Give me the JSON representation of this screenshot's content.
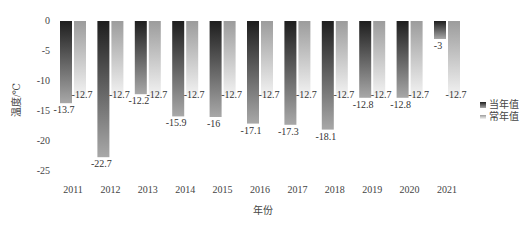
{
  "chart_data": {
    "type": "bar",
    "title": "",
    "xlabel": "年份",
    "ylabel": "温度/℃",
    "ylim": [
      -25,
      0
    ],
    "yticks": [
      0,
      -5,
      -10,
      -15,
      -20,
      -25
    ],
    "ytick_labels": [
      "0",
      "-5",
      "-10",
      "-15",
      "-20",
      "-25"
    ],
    "grid": false,
    "legend_position": "right",
    "categories": [
      "2011",
      "2012",
      "2013",
      "2014",
      "2015",
      "2016",
      "2017",
      "2018",
      "2019",
      "2020",
      "2021"
    ],
    "series": [
      {
        "name": "当年值",
        "color": "#2b2b2b",
        "values": [
          -13.7,
          -22.7,
          -12.2,
          -15.9,
          -16,
          -17.1,
          -17.3,
          -18.1,
          -12.8,
          -12.8,
          -3
        ],
        "labels": [
          "-13.7",
          "-22.7",
          "-12.2",
          "-15.9",
          "-16",
          "-17.1",
          "-17.3",
          "-18.1",
          "-12.8",
          "-12.8",
          "-3"
        ]
      },
      {
        "name": "常年值",
        "color": "#9a9a9a",
        "values": [
          -12.7,
          -12.7,
          -12.7,
          -12.7,
          -12.7,
          -12.7,
          -12.7,
          -12.7,
          -12.7,
          -12.7,
          -12.7
        ],
        "labels": [
          "-12.7",
          "-12.7",
          "-12.7",
          "-12.7",
          "-12.7",
          "-12.7",
          "-12.7",
          "-12.7",
          "-12.7",
          "-12.7",
          "-12.7"
        ]
      }
    ]
  },
  "legend": {
    "items": [
      {
        "label": "当年值"
      },
      {
        "label": "常年值"
      }
    ]
  },
  "axes": {
    "x_title": "年份",
    "y_title": "温度/℃"
  }
}
